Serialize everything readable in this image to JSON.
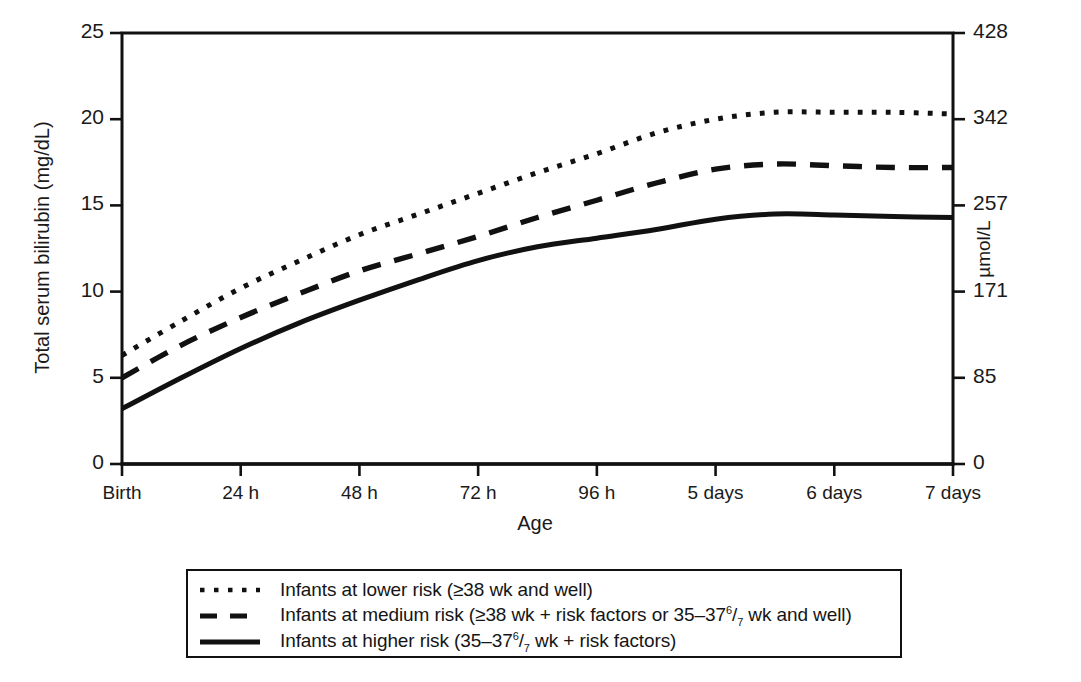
{
  "figure": {
    "kind": "line-chart",
    "background": "#ffffff",
    "ink_color": "#111111"
  },
  "axes": {
    "y_left": {
      "label": "Total serum bilirubin (mg/dL)",
      "ticks": [
        "0",
        "5",
        "10",
        "15",
        "20",
        "25"
      ],
      "min": 0,
      "max": 25
    },
    "y_right": {
      "label": "µmol/L",
      "ticks": [
        "0",
        "85",
        "171",
        "257",
        "342",
        "428"
      ],
      "min": 0,
      "max": 428
    },
    "x": {
      "label": "Age",
      "ticks": [
        "Birth",
        "24 h",
        "48 h",
        "72 h",
        "96 h",
        "5 days",
        "6 days",
        "7 days"
      ]
    }
  },
  "legend": {
    "items": [
      {
        "style": "dotted",
        "label": "Infants at lower risk (≥38 wk and well)",
        "label_parts": {
          "pre": "Infants at lower risk (≥38 wk and well)",
          "sup": "",
          "mid": "",
          "sub": "",
          "post": ""
        }
      },
      {
        "style": "dashed",
        "label": "Infants at medium risk (≥38 wk + risk factors or 35–37⁶/₇ wk and well)",
        "label_parts": {
          "pre": "Infants at medium risk (≥38 wk + risk factors or 35–37",
          "sup": "6",
          "mid": "/",
          "sub": "7",
          "post": " wk and well)"
        }
      },
      {
        "style": "solid",
        "label": "Infants at higher risk (35–37⁶/₇ wk + risk factors)",
        "label_parts": {
          "pre": "Infants at higher risk (35–37",
          "sup": "6",
          "mid": "/",
          "sub": "7",
          "post": " wk + risk factors)"
        }
      }
    ]
  },
  "chart_data": {
    "type": "line",
    "title": "",
    "xlabel": "Age",
    "ylabel": "Total serum bilirubin (mg/dL)",
    "ylabel_right": "µmol/L",
    "xlim": [
      0,
      168
    ],
    "ylim": [
      0,
      25
    ],
    "grid": false,
    "legend_position": "below-plot",
    "x_tick_labels": [
      "Birth",
      "24 h",
      "48 h",
      "72 h",
      "96 h",
      "5 days",
      "6 days",
      "7 days"
    ],
    "x_tick_hours": [
      0,
      24,
      48,
      72,
      96,
      120,
      144,
      168
    ],
    "y_tick_values": [
      0,
      5,
      10,
      15,
      20,
      25
    ],
    "y_right_tick_values": [
      0,
      85,
      171,
      257,
      342,
      428
    ],
    "x": [
      0,
      12,
      24,
      36,
      48,
      60,
      72,
      84,
      96,
      108,
      120,
      132,
      144,
      156,
      168
    ],
    "series": [
      {
        "name": "Infants at lower risk (≥38 wk and well)",
        "style": "dotted",
        "color": "#111111",
        "values": [
          6.3,
          8.3,
          10.2,
          11.8,
          13.3,
          14.5,
          15.7,
          16.9,
          18.0,
          19.2,
          20.0,
          20.4,
          20.4,
          20.4,
          20.3
        ]
      },
      {
        "name": "Infants at medium risk (≥38 wk + risk factors or 35–37⁶/₇ wk and well)",
        "style": "dashed",
        "color": "#111111",
        "values": [
          5.0,
          6.9,
          8.5,
          9.9,
          11.2,
          12.2,
          13.2,
          14.3,
          15.3,
          16.3,
          17.1,
          17.4,
          17.3,
          17.2,
          17.2
        ]
      },
      {
        "name": "Infants at higher risk (35–37⁶/₇ wk + risk factors)",
        "style": "solid",
        "color": "#111111",
        "values": [
          3.2,
          5.0,
          6.7,
          8.2,
          9.5,
          10.7,
          11.8,
          12.6,
          13.1,
          13.6,
          14.2,
          14.5,
          14.45,
          14.35,
          14.3
        ]
      }
    ]
  }
}
